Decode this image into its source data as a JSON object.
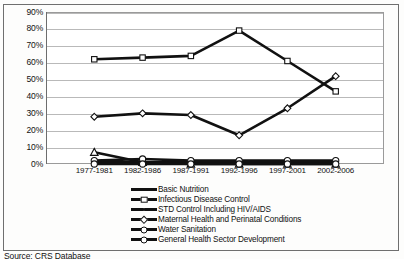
{
  "caption": "Source: CRS Database",
  "chart_data": {
    "type": "line",
    "title": "",
    "xlabel": "",
    "ylabel": "",
    "categories": [
      "1977-1981",
      "1982-1986",
      "1987-1991",
      "1992-1996",
      "1997-2001",
      "2002-2006"
    ],
    "ylim": [
      0,
      90
    ],
    "ytick_labels": [
      "0%",
      "10%",
      "20%",
      "30%",
      "40%",
      "50%",
      "60%",
      "70%",
      "80%",
      "90%"
    ],
    "ytick_values": [
      0,
      10,
      20,
      30,
      40,
      50,
      60,
      70,
      80,
      90
    ],
    "grid": true,
    "legend_position": "bottom",
    "series": [
      {
        "name": "Basic Nutrition",
        "marker": "none",
        "color": "#111111",
        "values": [
          1,
          1,
          1,
          1,
          1,
          1
        ]
      },
      {
        "name": "Infectious Disease Control",
        "marker": "square",
        "color": "#111111",
        "values": [
          62,
          63,
          64,
          79,
          61,
          43
        ]
      },
      {
        "name": "STD Control Including HIV/AIDS",
        "marker": "triangle",
        "color": "#111111",
        "values": [
          7,
          1,
          0,
          0,
          0,
          0
        ]
      },
      {
        "name": "Maternal Health and Perinatal Conditions",
        "marker": "diamond",
        "color": "#111111",
        "values": [
          28,
          30,
          29,
          17,
          33,
          52
        ]
      },
      {
        "name": "Water Sanitation",
        "marker": "circle",
        "color": "#111111",
        "values": [
          2,
          3,
          2,
          2,
          2,
          2
        ]
      },
      {
        "name": "General Health Sector Development",
        "marker": "circle",
        "color": "#111111",
        "values": [
          0,
          0,
          0,
          0,
          0,
          0
        ]
      }
    ]
  }
}
